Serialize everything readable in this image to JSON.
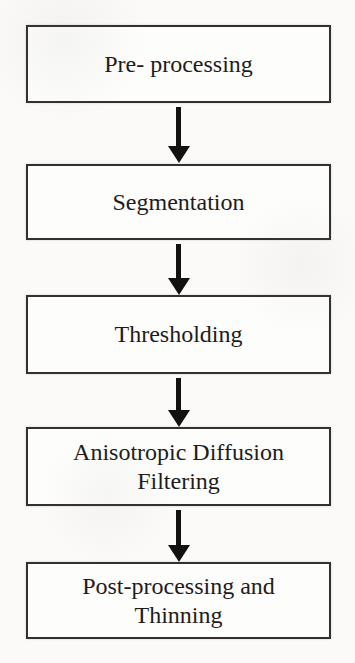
{
  "flowchart": {
    "type": "vertical-flowchart",
    "nodes": [
      {
        "id": "pre-processing",
        "label": "Pre- processing"
      },
      {
        "id": "segmentation",
        "label": "Segmentation"
      },
      {
        "id": "thresholding",
        "label": "Thresholding"
      },
      {
        "id": "anisotropic",
        "label": "Anisotropic Diffusion\nFiltering"
      },
      {
        "id": "post-processing",
        "label": "Post-processing and\nThinning"
      }
    ],
    "connectors": [
      {
        "from": 0,
        "to": 1,
        "style": "down-arrow"
      },
      {
        "from": 1,
        "to": 2,
        "style": "down-arrow"
      },
      {
        "from": 2,
        "to": 3,
        "style": "down-arrow"
      },
      {
        "from": 3,
        "to": 4,
        "style": "down-arrow"
      }
    ],
    "colors": {
      "background": "#fbfaf8",
      "box_fill": "#fdfdfc",
      "box_border": "#333130",
      "text": "#1d1c1b",
      "arrow": "#121110"
    }
  }
}
